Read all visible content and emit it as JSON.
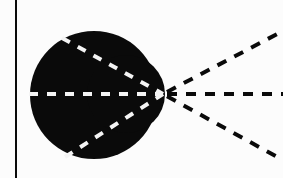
{
  "diagram": {
    "type": "ray-convergence",
    "canvas": {
      "width": 283,
      "height": 178
    },
    "colors": {
      "background": "#fcfcfc",
      "ink": "#0a0a0a",
      "inner_dash": "#f4f4f4"
    },
    "vertical_line": {
      "x": 16,
      "y1": 0,
      "y2": 178,
      "stroke_width": 2
    },
    "blob": {
      "description": "dark lens-like body formed by two overlapping discs",
      "main_disc": {
        "cx": 94,
        "cy": 95,
        "r": 64
      },
      "lobe_disc": {
        "cx": 126,
        "cy": 94,
        "r": 39
      }
    },
    "focal_point": {
      "x": 163,
      "y": 94
    },
    "rays": [
      {
        "name": "upper-ray",
        "inside_start": {
          "x": 62,
          "y": 38
        },
        "outside_end": {
          "x": 281,
          "y": 32
        }
      },
      {
        "name": "middle-ray",
        "inside_start": {
          "x": 29,
          "y": 94
        },
        "outside_end": {
          "x": 283,
          "y": 94
        }
      },
      {
        "name": "lower-ray",
        "inside_start": {
          "x": 65,
          "y": 157
        },
        "outside_end": {
          "x": 279,
          "y": 158
        }
      }
    ],
    "dash": {
      "length": 9,
      "gap": 9,
      "stroke_width": 4
    }
  }
}
